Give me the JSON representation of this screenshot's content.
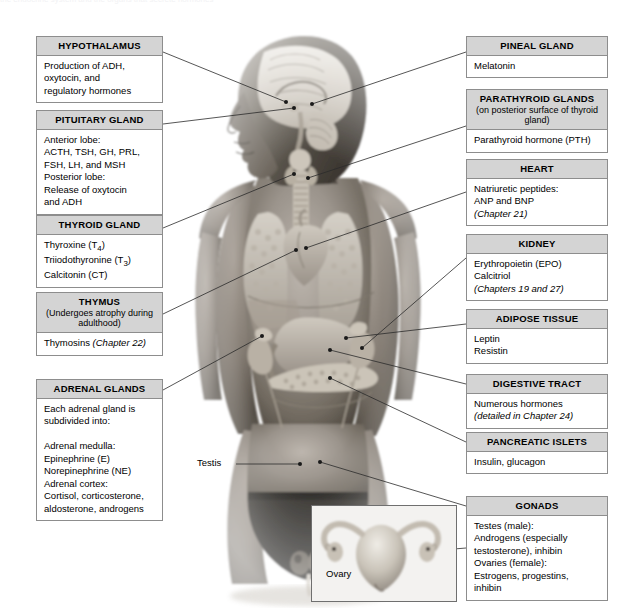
{
  "figure": {
    "title": "The Endocrine System",
    "background_color": "#ffffff",
    "header_fill": "#d4d4d4",
    "border_color": "#8d8d8d",
    "leader_color": "#2b2b2b",
    "clipped_top_text": "the endocrine system and the organs that secrete hormones"
  },
  "left_boxes": [
    {
      "id": "hypothalamus",
      "title": "HYPOTHALAMUS",
      "subtitle": "",
      "body": "Production of ADH,\noxytocin, and\nregulatory hormones",
      "italic_tail": ""
    },
    {
      "id": "pituitary-gland",
      "title": "PITUITARY GLAND",
      "subtitle": "",
      "body": "Anterior lobe:\n  ACTH, TSH, GH, PRL,\n  FSH, LH, and MSH\nPosterior lobe:\n  Release of oxytocin\n  and ADH",
      "italic_tail": ""
    },
    {
      "id": "thyroid-gland",
      "title": "THYROID GLAND",
      "subtitle": "",
      "body_html": "Thyroxine (T<sub>4</sub>)\nTriiodothyronine (T<sub>3</sub>)\nCalcitonin (CT)",
      "body": "Thyroxine (T4)\nTriiodothyronine (T3)\nCalcitonin (CT)",
      "italic_tail": ""
    },
    {
      "id": "thymus",
      "title": "THYMUS",
      "subtitle": "(Undergoes atrophy\nduring adulthood)",
      "body": "Thymosins ",
      "italic_tail": "(Chapter 22)"
    },
    {
      "id": "adrenal-glands",
      "title": "ADRENAL GLANDS",
      "subtitle": "",
      "body": "Each adrenal gland is\nsubdivided into:\n\nAdrenal medulla:\n  Epinephrine (E)\n  Norepinephrine (NE)\nAdrenal cortex:\n  Cortisol, corticosterone,\n  aldosterone, androgens",
      "italic_tail": ""
    }
  ],
  "right_boxes": [
    {
      "id": "pineal-gland",
      "title": "PINEAL GLAND",
      "subtitle": "",
      "body": "Melatonin",
      "italic_tail": ""
    },
    {
      "id": "parathyroid-glands",
      "title": "PARATHYROID GLANDS",
      "subtitle": "(on posterior surface of\nthyroid gland)",
      "body": "Parathyroid hormone (PTH)",
      "italic_tail": ""
    },
    {
      "id": "heart",
      "title": "HEART",
      "subtitle": "",
      "body": "Natriuretic peptides:\nANP and BNP\n",
      "italic_tail": "(Chapter 21)"
    },
    {
      "id": "kidney",
      "title": "KIDNEY",
      "subtitle": "",
      "body": "Erythropoietin (EPO)\nCalcitriol\n",
      "italic_tail": "(Chapters 19 and 27)"
    },
    {
      "id": "adipose-tissue",
      "title": "ADIPOSE TISSUE",
      "subtitle": "",
      "body": "Leptin\nResistin",
      "italic_tail": ""
    },
    {
      "id": "digestive-tract",
      "title": "DIGESTIVE TRACT",
      "subtitle": "",
      "body": "Numerous hormones\n",
      "italic_tail": "(detailed in Chapter 24)"
    },
    {
      "id": "pancreatic-islets",
      "title": "PANCREATIC ISLETS",
      "subtitle": "",
      "body": "Insulin, glucagon",
      "italic_tail": ""
    },
    {
      "id": "gonads",
      "title": "GONADS",
      "subtitle": "",
      "body": "Testes (male):\n  Androgens (especially\n  testosterone), inhibin\nOvaries (female):\n  Estrogens, progestins,\n  inhibin",
      "italic_tail": ""
    }
  ],
  "leader_labels": [
    {
      "id": "testis-label",
      "text": "Testis"
    },
    {
      "id": "ovary-label",
      "text": "Ovary"
    }
  ],
  "illustration": {
    "main": "anterior view of male body showing brain, thyroid, thymus, heart, lungs, liver, stomach, pancreas, adrenal glands, kidneys and testes",
    "inset": "female uterus with ovaries and uterine tubes"
  }
}
